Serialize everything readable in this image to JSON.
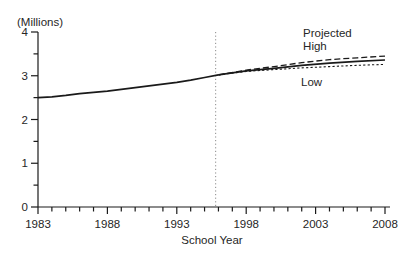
{
  "chart_data": {
    "type": "line",
    "title": "",
    "ylabel": "(Millions)",
    "xlabel": "School Year",
    "xlim": [
      1983,
      2008
    ],
    "ylim": [
      0,
      4
    ],
    "xticks_major": [
      1983,
      1988,
      1993,
      1998,
      2003,
      2008
    ],
    "xticks_minor_step": 1,
    "yticks_major": [
      0,
      1,
      2,
      3,
      4
    ],
    "yticks_minor": [
      0.5,
      1.5,
      2.5,
      3.5
    ],
    "grid": false,
    "legend": "none",
    "divider": {
      "year": 1995.8,
      "style": "dotted",
      "color": "#8a8a8a"
    },
    "series": [
      {
        "name": "Actual",
        "style": "solid",
        "color": "#1a1a1a",
        "width": 1.7,
        "x": [
          1983,
          1984,
          1985,
          1986,
          1987,
          1988,
          1989,
          1990,
          1991,
          1992,
          1993,
          1994,
          1995,
          1996
        ],
        "values": [
          2.5,
          2.52,
          2.55,
          2.59,
          2.62,
          2.65,
          2.69,
          2.73,
          2.77,
          2.81,
          2.85,
          2.9,
          2.96,
          3.02
        ]
      },
      {
        "name": "Projected (middle)",
        "style": "solid",
        "color": "#1a1a1a",
        "width": 1.7,
        "x": [
          1996,
          1998,
          2000,
          2002,
          2004,
          2006,
          2008
        ],
        "values": [
          3.02,
          3.11,
          3.17,
          3.24,
          3.29,
          3.33,
          3.36
        ]
      },
      {
        "name": "High",
        "style": "dashed",
        "color": "#1a1a1a",
        "width": 1.3,
        "x": [
          1996,
          1998,
          2000,
          2002,
          2004,
          2006,
          2008
        ],
        "values": [
          3.02,
          3.13,
          3.21,
          3.3,
          3.37,
          3.41,
          3.45
        ]
      },
      {
        "name": "Low",
        "style": "short-dash",
        "color": "#1a1a1a",
        "width": 1.1,
        "x": [
          1996,
          1998,
          2000,
          2002,
          2004,
          2006,
          2008
        ],
        "values": [
          3.02,
          3.1,
          3.14,
          3.18,
          3.21,
          3.24,
          3.26
        ]
      }
    ],
    "annotations": [
      {
        "text": "Projected",
        "year": 2002.1,
        "value": 3.98
      },
      {
        "text": "High",
        "year": 2002.1,
        "value": 3.69
      },
      {
        "text": "Low",
        "year": 2001.95,
        "value": 2.86
      }
    ],
    "colors": {
      "axis": "#1a1a1a",
      "text": "#262626",
      "background": "#ffffff"
    }
  }
}
